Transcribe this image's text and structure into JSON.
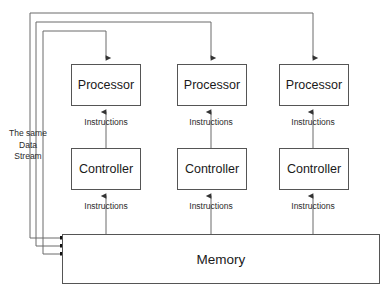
{
  "diagram": {
    "colors": {
      "background": "#ffffff",
      "box_border": "#555555",
      "line": "#6b6b6b",
      "text": "#1a1a1a",
      "dot": "#111111"
    },
    "side_label": {
      "line1": "The same",
      "line2": "Data",
      "line3": "Stream"
    },
    "columns": [
      {
        "processor": "Processor",
        "controller": "Controller",
        "label_proc_ctrl": "Instructions",
        "label_ctrl_mem": "Instructions"
      },
      {
        "processor": "Processor",
        "controller": "Controller",
        "label_proc_ctrl": "Instructions",
        "label_ctrl_mem": "Instructions"
      },
      {
        "processor": "Processor",
        "controller": "Controller",
        "label_proc_ctrl": "Instructions",
        "label_ctrl_mem": "Instructions"
      }
    ],
    "memory": {
      "label": "Memory"
    }
  }
}
